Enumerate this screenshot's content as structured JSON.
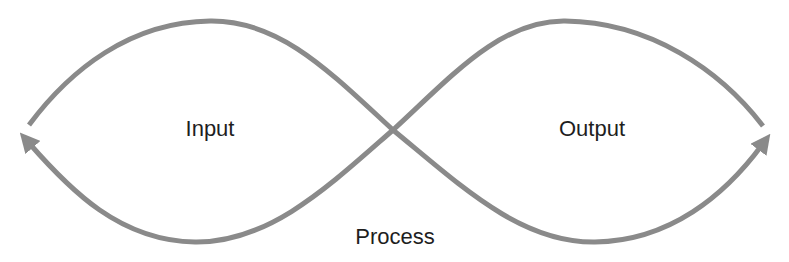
{
  "diagram": {
    "type": "infinity-loop",
    "stroke_color": "#8a8a8a",
    "text_color": "#1e1e1e",
    "background": "#ffffff",
    "labels": {
      "left_loop": "Input",
      "right_loop": "Output",
      "bottom_center": "Process"
    },
    "arrows": [
      {
        "position": "left-end",
        "direction": "up-left"
      },
      {
        "position": "right-end",
        "direction": "up-right"
      }
    ]
  }
}
